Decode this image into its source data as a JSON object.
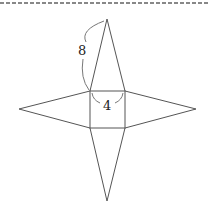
{
  "diagram": {
    "type": "net of square pyramid",
    "colors": {
      "line": "#555555",
      "arc": "#777777",
      "border_dash": "#888888",
      "label": "#222222"
    },
    "labels": {
      "slant_edge": "8",
      "base_edge": "4"
    },
    "shapes": {
      "base_square": {
        "x": 90,
        "y": 91,
        "w": 35,
        "h": 37
      },
      "triangles": [
        {
          "name": "top",
          "apex": [
            107,
            19
          ]
        },
        {
          "name": "left",
          "apex": [
            19,
            109
          ]
        },
        {
          "name": "right",
          "apex": [
            196,
            109
          ]
        },
        {
          "name": "bottom",
          "apex": [
            107,
            201
          ]
        }
      ]
    }
  }
}
